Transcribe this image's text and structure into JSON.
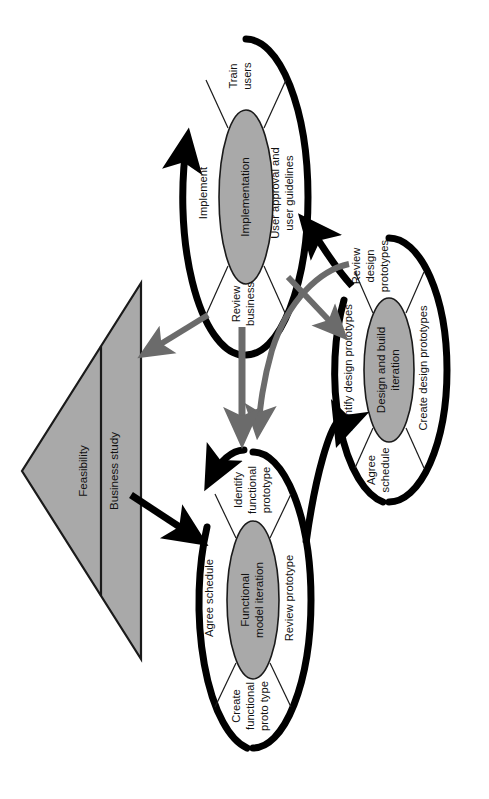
{
  "diagram": {
    "rotation_degrees": 90,
    "colors": {
      "shape_fill": "#a9a9a9",
      "shape_stroke": "#1a1a1a",
      "gray_arrow": "#6b6b6b",
      "black_arrow": "#000000",
      "background": "#ffffff"
    },
    "triangle": {
      "name": "feasibility-business-study-triangle",
      "labels": {
        "left": "Feasibility",
        "right": "Business study"
      }
    },
    "cycles": [
      {
        "id": "implementation",
        "core_label": "Implementation",
        "core_label_lines": [
          "Implementation"
        ],
        "activities": [
          "Train\nusers",
          "User approval and\nuser guidelines",
          "Review\nbusiness",
          "Implement"
        ],
        "activity_labels": {
          "train_users": "Train users",
          "user_approval": "User approval and user guidelines",
          "review_business": "Review business",
          "implement": "Implement"
        }
      },
      {
        "id": "design-and-build-iteration",
        "core_label": "Design and build iteration",
        "core_label_lines": [
          "Design and build",
          "iteration"
        ],
        "activity_labels": {
          "review_design_prototypes": "Review design prototypes",
          "create_design_prototypes": "Create design prototypes",
          "agree_schedule": "Agree schedule",
          "identify_design_prototypes": "Identify design prototypes"
        }
      },
      {
        "id": "functional-model-iteration",
        "core_label": "Functional model iteration",
        "core_label_lines": [
          "Functional",
          "model iteration"
        ],
        "activity_labels": {
          "identify_functional_prototype": "Identify functional prototype",
          "review_prototype": "Review prototype",
          "create_functional_proto_type": "Create functional proto type",
          "agree_schedule": "Agree schedule"
        }
      }
    ],
    "connectors": [
      {
        "id": "business-study-to-functional-model",
        "color": "#000000",
        "from": "Business study",
        "to": "Functional model iteration"
      },
      {
        "id": "implementation-to-business-study",
        "color": "#6b6b6b",
        "from": "Implementation",
        "to": "Business study"
      },
      {
        "id": "business-study-to-design-build",
        "color": "#6b6b6b",
        "from": "Business study",
        "to": "Design and build iteration"
      },
      {
        "id": "design-build-to-functional-model",
        "color": "#6b6b6b",
        "from": "Design and build iteration",
        "to": "Functional model iteration"
      },
      {
        "id": "implementation-to-functional-model",
        "color": "#6b6b6b",
        "from": "Implementation",
        "to": "Functional model iteration"
      },
      {
        "id": "functional-model-to-design-build",
        "color": "#000000",
        "from": "Functional model iteration",
        "to": "Design and build iteration"
      },
      {
        "id": "design-build-to-implementation",
        "color": "#000000",
        "from": "Design and build iteration",
        "to": "Implementation"
      }
    ]
  }
}
